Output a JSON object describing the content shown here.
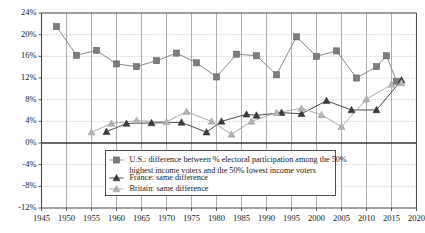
{
  "chart_data": {
    "type": "line",
    "title": "",
    "subtitle": "",
    "xlabel": "",
    "ylabel": "",
    "xlim": [
      1945,
      2020
    ],
    "ylim": [
      -12,
      24
    ],
    "grid": true,
    "legend_position": "bottom-center",
    "x_ticks": [
      1945,
      1950,
      1955,
      1960,
      1965,
      1970,
      1975,
      1980,
      1985,
      1990,
      1995,
      2000,
      2005,
      2010,
      2015,
      2020
    ],
    "y_ticks": [
      -12,
      -8,
      -4,
      0,
      4,
      8,
      12,
      16,
      20,
      24
    ],
    "y_tick_labels": [
      "-12%",
      "-8%",
      "-4%",
      "0%",
      "4%",
      "8%",
      "12%",
      "16%",
      "20%",
      "24%"
    ],
    "x_tick_labels": [
      "1945",
      "1950",
      "1955",
      "1960",
      "1965",
      "1970",
      "1975",
      "1980",
      "1985",
      "1990",
      "1995",
      "2000",
      "2005",
      "2010",
      "2015",
      "2020"
    ],
    "series": [
      {
        "name": "U.S.: difference between % electoral participation among the 50% highest income voters and the 50% lowest income voters",
        "legend_label_line1": "U.S.: difference between % electoral participation among the 50%",
        "legend_label_line2": "highest income voters and the 50% lowest income voters",
        "marker": "square",
        "color": "#7d7d7d",
        "points": [
          [
            1948,
            21.5
          ],
          [
            1952,
            16.2
          ],
          [
            1956,
            17.1
          ],
          [
            1960,
            14.6
          ],
          [
            1964,
            14.1
          ],
          [
            1968,
            15.2
          ],
          [
            1972,
            16.6
          ],
          [
            1976,
            14.8
          ],
          [
            1980,
            12.2
          ],
          [
            1984,
            16.4
          ],
          [
            1988,
            16.1
          ],
          [
            1992,
            12.6
          ],
          [
            1996,
            19.6
          ],
          [
            2000,
            16.0
          ],
          [
            2004,
            17.0
          ],
          [
            2008,
            12.0
          ],
          [
            2012,
            14.1
          ],
          [
            2014,
            16.1
          ],
          [
            2016,
            11.4
          ]
        ]
      },
      {
        "name": "France: same difference",
        "legend_label_line1": "France: same difference",
        "marker": "triangle",
        "color": "#3c3c3c",
        "points": [
          [
            1958,
            2.1
          ],
          [
            1962,
            3.6
          ],
          [
            1967,
            3.7
          ],
          [
            1973,
            3.8
          ],
          [
            1978,
            2.0
          ],
          [
            1981,
            4.0
          ],
          [
            1986,
            5.3
          ],
          [
            1988,
            5.1
          ],
          [
            1993,
            5.6
          ],
          [
            1997,
            5.4
          ],
          [
            2002,
            7.8
          ],
          [
            2007,
            6.1
          ],
          [
            2012,
            6.1
          ],
          [
            2017,
            11.6
          ]
        ]
      },
      {
        "name": "Britain: same difference",
        "legend_label_line1": "Britain: same difference",
        "marker": "triangle",
        "color": "#b4b4b4",
        "points": [
          [
            1955,
            2.0
          ],
          [
            1959,
            3.6
          ],
          [
            1964,
            4.1
          ],
          [
            1970,
            3.9
          ],
          [
            1974,
            5.8
          ],
          [
            1979,
            4.0
          ],
          [
            1983,
            1.6
          ],
          [
            1987,
            4.0
          ],
          [
            1992,
            5.6
          ],
          [
            1997,
            6.4
          ],
          [
            2001,
            5.2
          ],
          [
            2005,
            3.0
          ],
          [
            2010,
            8.1
          ],
          [
            2015,
            10.8
          ],
          [
            2017,
            11.1
          ]
        ]
      }
    ]
  },
  "legend": {
    "items": [
      {
        "key": "us",
        "marker": "square-marker-icon",
        "line1": "U.S.: difference between % electoral participation among the 50%",
        "line2": "highest income voters and the 50% lowest income voters"
      },
      {
        "key": "france",
        "marker": "triangle-marker-icon",
        "line1": "France: same difference"
      },
      {
        "key": "britain",
        "marker": "triangle-marker-icon",
        "line1": "Britain: same difference"
      }
    ]
  }
}
